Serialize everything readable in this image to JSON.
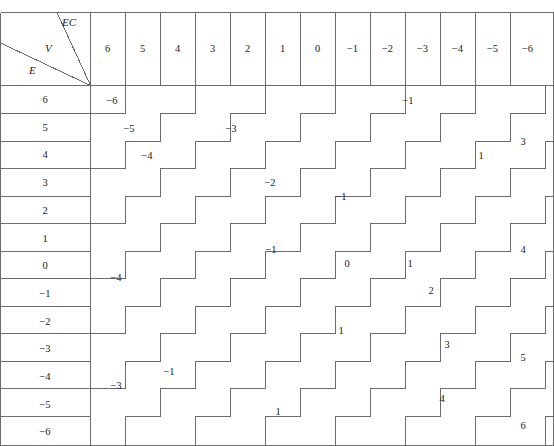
{
  "page": {
    "running_header": "",
    "table_type": "two-way staircase band table"
  },
  "corner": {
    "axis_top_right_label": "EC",
    "axis_middle_label": "V",
    "axis_bottom_left_label": "E"
  },
  "columns": {
    "header_label": "EC",
    "values": [
      "6",
      "5",
      "4",
      "3",
      "2",
      "1",
      "0",
      "−1",
      "−2",
      "−3",
      "−4",
      "−5",
      "−6"
    ]
  },
  "rows": {
    "header_label": "E",
    "values": [
      "6",
      "5",
      "4",
      "3",
      "2",
      "1",
      "0",
      "−1",
      "−2",
      "−3",
      "−4",
      "−5",
      "−6"
    ]
  },
  "chart_data": {
    "type": "table",
    "title": "",
    "xlabel": "EC",
    "ylabel": "E",
    "categories": [
      "6",
      "5",
      "4",
      "3",
      "2",
      "1",
      "0",
      "−1",
      "−2",
      "−3",
      "−4",
      "−5",
      "−6"
    ],
    "row_categories": [
      "6",
      "5",
      "4",
      "3",
      "2",
      "1",
      "0",
      "−1",
      "−2",
      "−3",
      "−4",
      "−5",
      "−6"
    ],
    "grid": true,
    "legend": "none",
    "note": "Cell value V equals the staircase band index; bands run diagonally from upper-left (most negative) to lower-right (most positive).",
    "cells": [
      [
        "−6",
        "−5",
        "−5",
        "−4",
        "−4",
        "−3",
        "−3",
        "−2",
        "−2",
        "−1",
        "−1",
        "0",
        "0"
      ],
      [
        "−5",
        "−5",
        "−4",
        "−4",
        "−3",
        "−3",
        "−2",
        "−2",
        "−1",
        "−1",
        "0",
        "0",
        "1"
      ],
      [
        "−5",
        "−4",
        "−4",
        "−3",
        "−3",
        "−2",
        "−2",
        "−1",
        "−1",
        "0",
        "0",
        "1",
        "1"
      ],
      [
        "−4",
        "−4",
        "−3",
        "−3",
        "−2",
        "−2",
        "−1",
        "−1",
        "0",
        "0",
        "1",
        "1",
        "2"
      ],
      [
        "−4",
        "−3",
        "−3",
        "−2",
        "−2",
        "−1",
        "−1",
        "0",
        "0",
        "1",
        "1",
        "2",
        "2"
      ],
      [
        "−3",
        "−3",
        "−2",
        "−2",
        "−1",
        "−1",
        "0",
        "0",
        "1",
        "1",
        "2",
        "2",
        "3"
      ],
      [
        "−3",
        "−2",
        "−2",
        "−1",
        "−1",
        "0",
        "0",
        "1",
        "1",
        "2",
        "2",
        "3",
        "3"
      ],
      [
        "−2",
        "−2",
        "−1",
        "−1",
        "0",
        "0",
        "1",
        "1",
        "2",
        "2",
        "3",
        "3",
        "4"
      ],
      [
        "−2",
        "−1",
        "−1",
        "0",
        "0",
        "1",
        "1",
        "2",
        "2",
        "3",
        "3",
        "4",
        "4"
      ],
      [
        "−1",
        "−1",
        "0",
        "0",
        "1",
        "1",
        "2",
        "2",
        "3",
        "3",
        "4",
        "4",
        "5"
      ],
      [
        "−1",
        "0",
        "0",
        "1",
        "1",
        "2",
        "2",
        "3",
        "3",
        "4",
        "4",
        "5",
        "5"
      ],
      [
        "0",
        "0",
        "1",
        "1",
        "2",
        "2",
        "3",
        "3",
        "4",
        "4",
        "5",
        "5",
        "6"
      ],
      [
        "0",
        "1",
        "1",
        "2",
        "2",
        "3",
        "3",
        "4",
        "4",
        "5",
        "5",
        "6",
        "6"
      ]
    ],
    "band_labels": [
      {
        "value": "−6",
        "x": 112,
        "y": 100
      },
      {
        "value": "−5",
        "x": 129,
        "y": 128
      },
      {
        "value": "−4",
        "x": 147,
        "y": 155
      },
      {
        "value": "−3",
        "x": 231,
        "y": 128
      },
      {
        "value": "−2",
        "x": 270,
        "y": 182
      },
      {
        "value": "−1",
        "x": 408,
        "y": 100
      },
      {
        "value": "−1",
        "x": 271,
        "y": 249
      },
      {
        "value": "−1",
        "x": 341,
        "y": 196
      },
      {
        "value": "0",
        "x": 347,
        "y": 263
      },
      {
        "value": "1",
        "x": 410,
        "y": 263
      },
      {
        "value": "1",
        "x": 481,
        "y": 155
      },
      {
        "value": "3",
        "x": 523,
        "y": 141
      },
      {
        "value": "2",
        "x": 431,
        "y": 290
      },
      {
        "value": "−1",
        "x": 169,
        "y": 371
      },
      {
        "value": "−4",
        "x": 116,
        "y": 277
      },
      {
        "value": "−3",
        "x": 116,
        "y": 385
      },
      {
        "value": "1",
        "x": 341,
        "y": 330
      },
      {
        "value": "3",
        "x": 447,
        "y": 344
      },
      {
        "value": "4",
        "x": 523,
        "y": 249
      },
      {
        "value": "1",
        "x": 278,
        "y": 411
      },
      {
        "value": "4",
        "x": 442,
        "y": 398
      },
      {
        "value": "5",
        "x": 523,
        "y": 357
      },
      {
        "value": "6",
        "x": 523,
        "y": 425
      }
    ]
  }
}
